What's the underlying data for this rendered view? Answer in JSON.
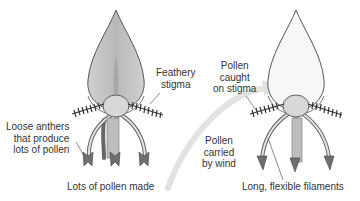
{
  "diagram": {
    "type": "biology-illustration",
    "colors": {
      "petal_left": "#c8c8c8",
      "petal_right": "#f7f7f7",
      "outline": "#555555",
      "ovary": "#d8d8d8",
      "anther": "#6e6e6e",
      "arrow": "#e2e2e2",
      "text": "#333333"
    },
    "left_flower": {
      "name": "Pollen-producing flower",
      "labels": {
        "feathery_stigma": [
          "Feathery",
          "stigma"
        ],
        "loose_anthers": [
          "Loose anthers",
          "that produce",
          "lots of pollen"
        ],
        "pollen_made": "Lots of pollen made"
      }
    },
    "right_flower": {
      "name": "Pollen-receiving flower",
      "labels": {
        "pollen_caught": [
          "Pollen",
          "caught",
          "on stigma"
        ],
        "filaments": "Long, flexible filaments"
      }
    },
    "arrow": {
      "labels": [
        "Pollen",
        "carried",
        "by wind"
      ]
    }
  }
}
